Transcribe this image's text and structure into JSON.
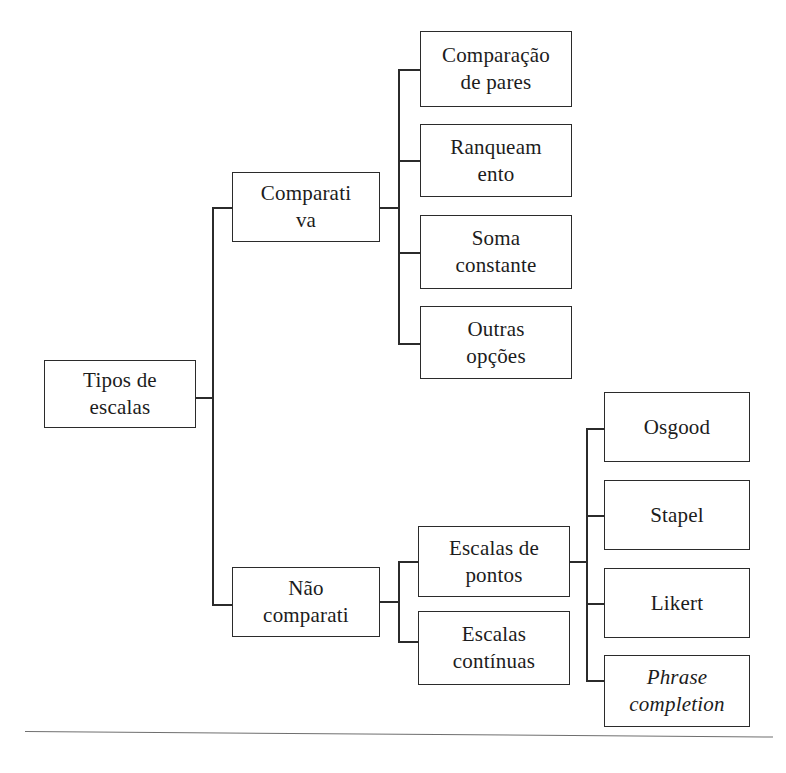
{
  "diagram": {
    "type": "tree-hierarchy",
    "orientation": "left-to-right",
    "title": "Tipos de escalas",
    "root": {
      "id": "tipos-de-escalas",
      "label": "Tipos de\nescalas"
    },
    "branches": [
      {
        "id": "comparativa",
        "label": "Comparati\nva",
        "children": [
          {
            "id": "comparacao-de-pares",
            "label": "Comparação\nde pares"
          },
          {
            "id": "ranqueamento",
            "label": "Ranqueam\nento"
          },
          {
            "id": "soma-constante",
            "label": "Soma\nconstante"
          },
          {
            "id": "outras-opcoes",
            "label": "Outras\nopções"
          }
        ]
      },
      {
        "id": "nao-comparativa",
        "label": "Não\ncomparati",
        "children": [
          {
            "id": "escalas-de-pontos",
            "label": "Escalas de\npontos",
            "children": [
              {
                "id": "osgood",
                "label": "Osgood",
                "style": "normal"
              },
              {
                "id": "stapel",
                "label": "Stapel",
                "style": "normal"
              },
              {
                "id": "likert",
                "label": "Likert",
                "style": "normal"
              },
              {
                "id": "phrase-completion",
                "label": "Phrase\ncompletion",
                "style": "italic"
              }
            ]
          },
          {
            "id": "escalas-continuas",
            "label": "Escalas\ncontínuas"
          }
        ]
      }
    ],
    "colors": {
      "box_border": "#2b2b2b",
      "connector": "#2b2b2b",
      "background": "#ffffff",
      "text": "#1c1c1c",
      "footer_rule": "#6f6f6f"
    }
  }
}
